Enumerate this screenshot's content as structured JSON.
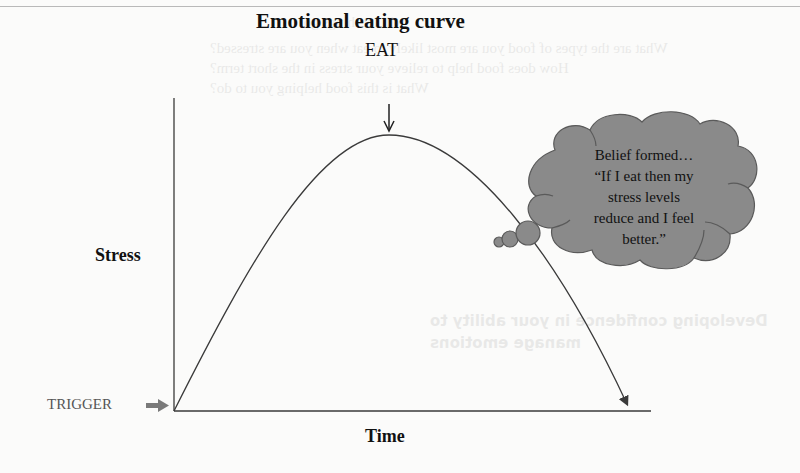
{
  "figure": {
    "title": "Emotional eating curve",
    "peak_label": "EAT",
    "y_axis_label": "Stress",
    "x_axis_label": "Time",
    "origin_label": "TRIGGER",
    "thought_cloud": {
      "lines": [
        "Belief formed…",
        "“If I eat then my",
        "stress levels",
        "reduce and I feel",
        "better.”"
      ]
    },
    "colors": {
      "line": "#3a3a3a",
      "cloud_fill": "#8a8a8a",
      "cloud_stroke": "#5a5a5a",
      "trigger_arrow": "#7a7a7a",
      "page_bg": "#fbfbfa"
    },
    "curve": {
      "shape": "inverted-parabola",
      "start": "trigger (low stress)",
      "peak": "EAT (maximum stress)",
      "end": "stress falls back toward baseline"
    }
  },
  "bleed_through": {
    "lines": [
      "will let things go.",
      "What are the types of food you are most likely to eat when you are stressed?",
      "How does food help to relieve your stress in the short term?",
      "What is this food helping you to do?",
      "Developing confidence in your ability to",
      "manage emotions"
    ]
  }
}
